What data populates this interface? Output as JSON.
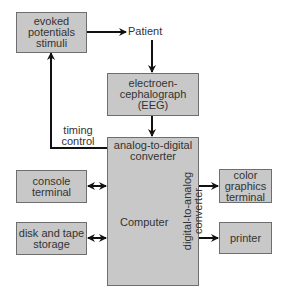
{
  "diagram": {
    "nodes": {
      "evoked": {
        "label": "evoked\npotentials\nstimuli"
      },
      "patient": {
        "label": "Patient"
      },
      "eeg": {
        "label": "electroen-\ncephalograph\n(EEG)"
      },
      "computer": {
        "label": "Computer",
        "adc": "analog-to-digital\nconverter",
        "dac": "digital-to-analog\nconverter"
      },
      "console": {
        "label": "console\nterminal"
      },
      "disk": {
        "label": "disk and tape\nstorage"
      },
      "color_graphics": {
        "label": "color\ngraphics\nterminal"
      },
      "printer": {
        "label": "printer"
      }
    },
    "edges": {
      "timing": {
        "label": "timing\ncontrol"
      }
    },
    "colors": {
      "box_fill": "#c8c8c8",
      "box_border": "#6e6e6e",
      "line": "#111111"
    }
  }
}
